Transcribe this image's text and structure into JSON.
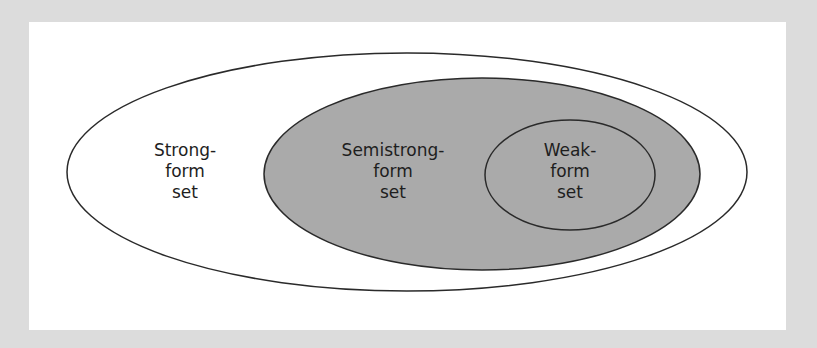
{
  "diagram": {
    "colors": {
      "background": "#dcdcdc",
      "panel": "#ffffff",
      "outline": "#2a2a2a",
      "fill_inner": "#aaaaaa",
      "text": "#1e1e1e"
    },
    "sets": [
      {
        "id": "strong",
        "lines": [
          "Strong-",
          "form",
          "set"
        ],
        "ellipse": {
          "cx": 407,
          "cy": 172,
          "rx": 340,
          "ry": 119
        },
        "fill": "#ffffff"
      },
      {
        "id": "semistrong",
        "lines": [
          "Semistrong-",
          "form",
          "set"
        ],
        "ellipse": {
          "cx": 482,
          "cy": 174,
          "rx": 218,
          "ry": 96
        },
        "fill": "#aaaaaa"
      },
      {
        "id": "weak",
        "lines": [
          "Weak-",
          "form",
          "set"
        ],
        "ellipse": {
          "cx": 570,
          "cy": 175,
          "rx": 85,
          "ry": 55
        },
        "fill": "#aaaaaa"
      }
    ]
  }
}
